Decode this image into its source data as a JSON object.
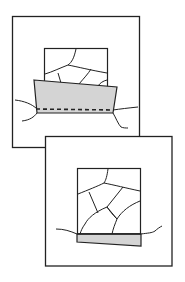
{
  "figure": {
    "colors": {
      "stroke": "#222222",
      "shade": "#d4d4d4",
      "background": "#ffffff"
    },
    "panels": [
      {
        "id": "panel-top",
        "outer_box": {
          "x": 12,
          "y": 16,
          "w": 127,
          "h": 131
        },
        "inner_box": {
          "x": 44,
          "y": 48,
          "w": 63,
          "h": 35
        },
        "shaded_slab": [
          [
            34,
            80
          ],
          [
            117,
            87
          ],
          [
            113,
            113
          ],
          [
            37,
            113
          ]
        ],
        "dashed_line_y": 109
      },
      {
        "id": "panel-bottom",
        "outer_box": {
          "x": 45,
          "y": 136,
          "w": 127,
          "h": 130
        },
        "inner_box": {
          "x": 77,
          "y": 168,
          "w": 63,
          "h": 66
        },
        "shaded_wedge": [
          [
            77,
            234
          ],
          [
            141,
            234
          ],
          [
            141,
            246
          ],
          [
            77,
            242
          ]
        ]
      }
    ]
  }
}
